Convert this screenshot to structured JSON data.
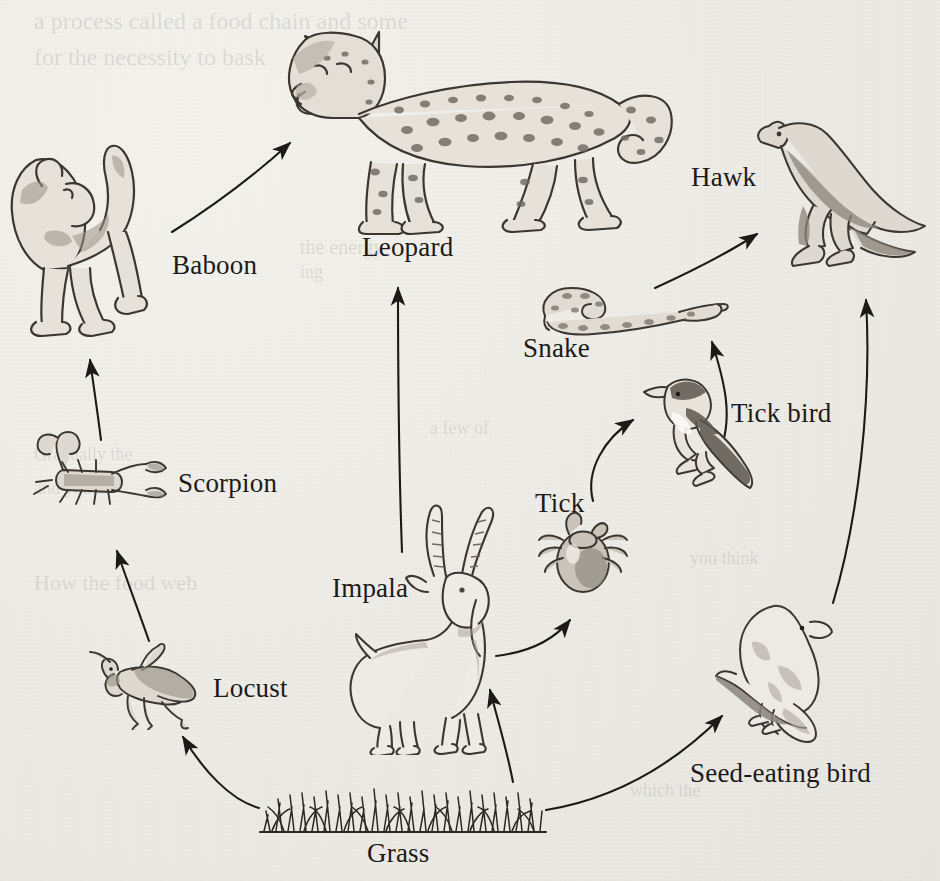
{
  "diagram": {
    "type": "food-web",
    "background_color": "#efeee9",
    "ink_color": "#1c1a17",
    "arrow_meaning": "energy flows from prey to predator (arrow points to consumer)"
  },
  "nodes": [
    {
      "id": "baboon",
      "label": "Baboon",
      "label_x": 172,
      "label_y": 252,
      "art_x": 8,
      "art_y": 128,
      "art_w": 160,
      "art_h": 210,
      "trophic": "omnivore"
    },
    {
      "id": "leopard",
      "label": "Leopard",
      "label_x": 362,
      "label_y": 234,
      "art_x": 275,
      "art_y": 22,
      "art_w": 400,
      "art_h": 215,
      "trophic": "top-predator"
    },
    {
      "id": "hawk",
      "label": "Hawk",
      "label_x": 691,
      "label_y": 164,
      "art_x": 753,
      "art_y": 110,
      "art_w": 180,
      "art_h": 160,
      "trophic": "top-predator"
    },
    {
      "id": "snake",
      "label": "Snake",
      "label_x": 523,
      "label_y": 335,
      "art_x": 533,
      "art_y": 280,
      "art_w": 200,
      "art_h": 60,
      "trophic": "secondary-consumer"
    },
    {
      "id": "tick-bird",
      "label": "Tick bird",
      "label_x": 731,
      "label_y": 400,
      "art_x": 640,
      "art_y": 368,
      "art_w": 120,
      "art_h": 125,
      "trophic": "secondary-consumer"
    },
    {
      "id": "scorpion",
      "label": "Scorpion",
      "label_x": 178,
      "label_y": 470,
      "art_x": 28,
      "art_y": 428,
      "art_w": 145,
      "art_h": 80,
      "trophic": "secondary-consumer"
    },
    {
      "id": "tick",
      "label": "Tick",
      "label_x": 535,
      "label_y": 490,
      "art_x": 533,
      "art_y": 500,
      "art_w": 100,
      "art_h": 100,
      "trophic": "parasite"
    },
    {
      "id": "impala",
      "label": "Impala",
      "label_x": 332,
      "label_y": 575,
      "art_x": 330,
      "art_y": 500,
      "art_w": 200,
      "art_h": 255,
      "trophic": "herbivore"
    },
    {
      "id": "locust",
      "label": "Locust",
      "label_x": 213,
      "label_y": 675,
      "art_x": 88,
      "art_y": 640,
      "art_w": 125,
      "art_h": 90,
      "trophic": "herbivore"
    },
    {
      "id": "seed-eating-bird",
      "label": "Seed-eating bird",
      "label_x": 690,
      "label_y": 760,
      "art_x": 712,
      "art_y": 592,
      "art_w": 140,
      "art_h": 155,
      "trophic": "herbivore"
    },
    {
      "id": "grass",
      "label": "Grass",
      "label_x": 367,
      "label_y": 840,
      "art_x": 258,
      "art_y": 785,
      "art_w": 290,
      "art_h": 50,
      "trophic": "producer"
    }
  ],
  "links": [
    {
      "from": "baboon",
      "to": "leopard",
      "path": "M172,232 C215,205 258,172 290,143"
    },
    {
      "from": "impala",
      "to": "leopard",
      "path": "M402,552 C399,470 398,360 398,288"
    },
    {
      "from": "scorpion",
      "to": "baboon",
      "path": "M101,440 C97,408 93,382 90,360"
    },
    {
      "from": "locust",
      "to": "scorpion",
      "path": "M149,641 C139,612 126,578 117,551"
    },
    {
      "from": "grass",
      "to": "locust",
      "path": "M259,808 C230,800 203,770 183,737"
    },
    {
      "from": "grass",
      "to": "impala",
      "path": "M513,782 C506,746 496,714 490,690"
    },
    {
      "from": "impala",
      "to": "tick",
      "path": "M496,656 C530,652 554,640 570,620"
    },
    {
      "from": "tick",
      "to": "tick-bird",
      "path": "M593,501 C585,470 605,438 633,420"
    },
    {
      "from": "tick-bird",
      "to": "snake",
      "path": "M718,455 C735,420 724,380 712,342"
    },
    {
      "from": "snake",
      "to": "hawk",
      "path": "M655,288 C690,272 728,253 757,234"
    },
    {
      "from": "grass",
      "to": "seed-eating-bird",
      "path": "M546,810 C620,798 678,760 722,716"
    },
    {
      "from": "seed-eating-bird",
      "to": "hawk",
      "path": "M833,603 C858,520 872,400 866,300"
    }
  ],
  "bleed_through_lines": [
    {
      "text": "a process called a food chain and some",
      "x": 34,
      "y": 8,
      "size": 24,
      "rotate": 0
    },
    {
      "text": "for the necessity to bask",
      "x": 34,
      "y": 44,
      "size": 24,
      "rotate": 0
    },
    {
      "text": "the energy",
      "x": 300,
      "y": 236,
      "size": 20,
      "rotate": 0
    },
    {
      "text": "ing",
      "x": 300,
      "y": 262,
      "size": 18,
      "rotate": 0
    },
    {
      "text": "a few of",
      "x": 430,
      "y": 418,
      "size": 18,
      "rotate": 0
    },
    {
      "text": "Gradually the",
      "x": 34,
      "y": 444,
      "size": 18,
      "rotate": 0
    },
    {
      "text": "and you a",
      "x": 34,
      "y": 478,
      "size": 18,
      "rotate": 0
    },
    {
      "text": "How the food web",
      "x": 34,
      "y": 570,
      "size": 22,
      "rotate": 0
    },
    {
      "text": "you think",
      "x": 690,
      "y": 548,
      "size": 18,
      "rotate": 0
    },
    {
      "text": "which the",
      "x": 630,
      "y": 780,
      "size": 18,
      "rotate": 0
    }
  ]
}
